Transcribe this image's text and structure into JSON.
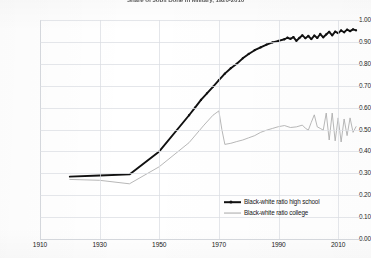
{
  "chart_data": {
    "type": "line",
    "title": "Share of Jobs Done in Military, 1920-2010",
    "xlabel": "",
    "ylabel": "",
    "xlim": [
      1910,
      2018
    ],
    "ylim": [
      0.0,
      1.0
    ],
    "grid": true,
    "legend_position": "bottom-right",
    "xticks": [
      1910,
      1930,
      1950,
      1970,
      1990,
      2010
    ],
    "yticks": [
      "0.00",
      "0.10",
      "0.20",
      "0.30",
      "0.40",
      "0.50",
      "0.60",
      "0.70",
      "0.80",
      "0.90",
      "1.00"
    ],
    "series": [
      {
        "name": "Black-white ratio high school",
        "color": "#111111",
        "x": [
          1920,
          1930,
          1940,
          1950,
          1960,
          1962,
          1964,
          1966,
          1968,
          1970,
          1972,
          1974,
          1976,
          1978,
          1980,
          1982,
          1984,
          1986,
          1988,
          1990,
          1992,
          1993,
          1994,
          1995,
          1996,
          1997,
          1998,
          1999,
          2000,
          2001,
          2002,
          2003,
          2004,
          2005,
          2006,
          2007,
          2008,
          2009,
          2010,
          2011,
          2012,
          2013,
          2014,
          2015,
          2016
        ],
        "values": [
          0.285,
          0.29,
          0.295,
          0.4,
          0.565,
          0.6,
          0.635,
          0.665,
          0.695,
          0.725,
          0.755,
          0.78,
          0.8,
          0.825,
          0.845,
          0.862,
          0.875,
          0.888,
          0.898,
          0.905,
          0.912,
          0.919,
          0.914,
          0.922,
          0.905,
          0.918,
          0.93,
          0.917,
          0.927,
          0.913,
          0.929,
          0.918,
          0.936,
          0.921,
          0.934,
          0.946,
          0.93,
          0.947,
          0.94,
          0.952,
          0.944,
          0.956,
          0.949,
          0.957,
          0.953
        ]
      },
      {
        "name": "Black-white ratio college",
        "color": "#aaaaaa",
        "x": [
          1920,
          1930,
          1940,
          1950,
          1960,
          1965,
          1968,
          1970,
          1971,
          1972,
          1974,
          1976,
          1978,
          1980,
          1982,
          1984,
          1986,
          1988,
          1990,
          1992,
          1994,
          1996,
          1998,
          1999,
          2000,
          2001,
          2002,
          2003,
          2004,
          2005,
          2006,
          2007,
          2008,
          2009,
          2010,
          2011,
          2012,
          2013,
          2014,
          2015,
          2016
        ],
        "values": [
          0.272,
          0.268,
          0.252,
          0.33,
          0.44,
          0.52,
          0.565,
          0.585,
          0.5,
          0.432,
          0.437,
          0.445,
          0.452,
          0.462,
          0.472,
          0.487,
          0.497,
          0.505,
          0.513,
          0.518,
          0.509,
          0.512,
          0.52,
          0.506,
          0.497,
          0.533,
          0.567,
          0.512,
          0.505,
          0.497,
          0.575,
          0.452,
          0.575,
          0.448,
          0.553,
          0.443,
          0.548,
          0.472,
          0.553,
          0.487,
          0.513
        ]
      }
    ]
  },
  "legend": {
    "items": [
      {
        "label": "Black-white ratio high school"
      },
      {
        "label": "Black-white ratio college"
      }
    ]
  }
}
